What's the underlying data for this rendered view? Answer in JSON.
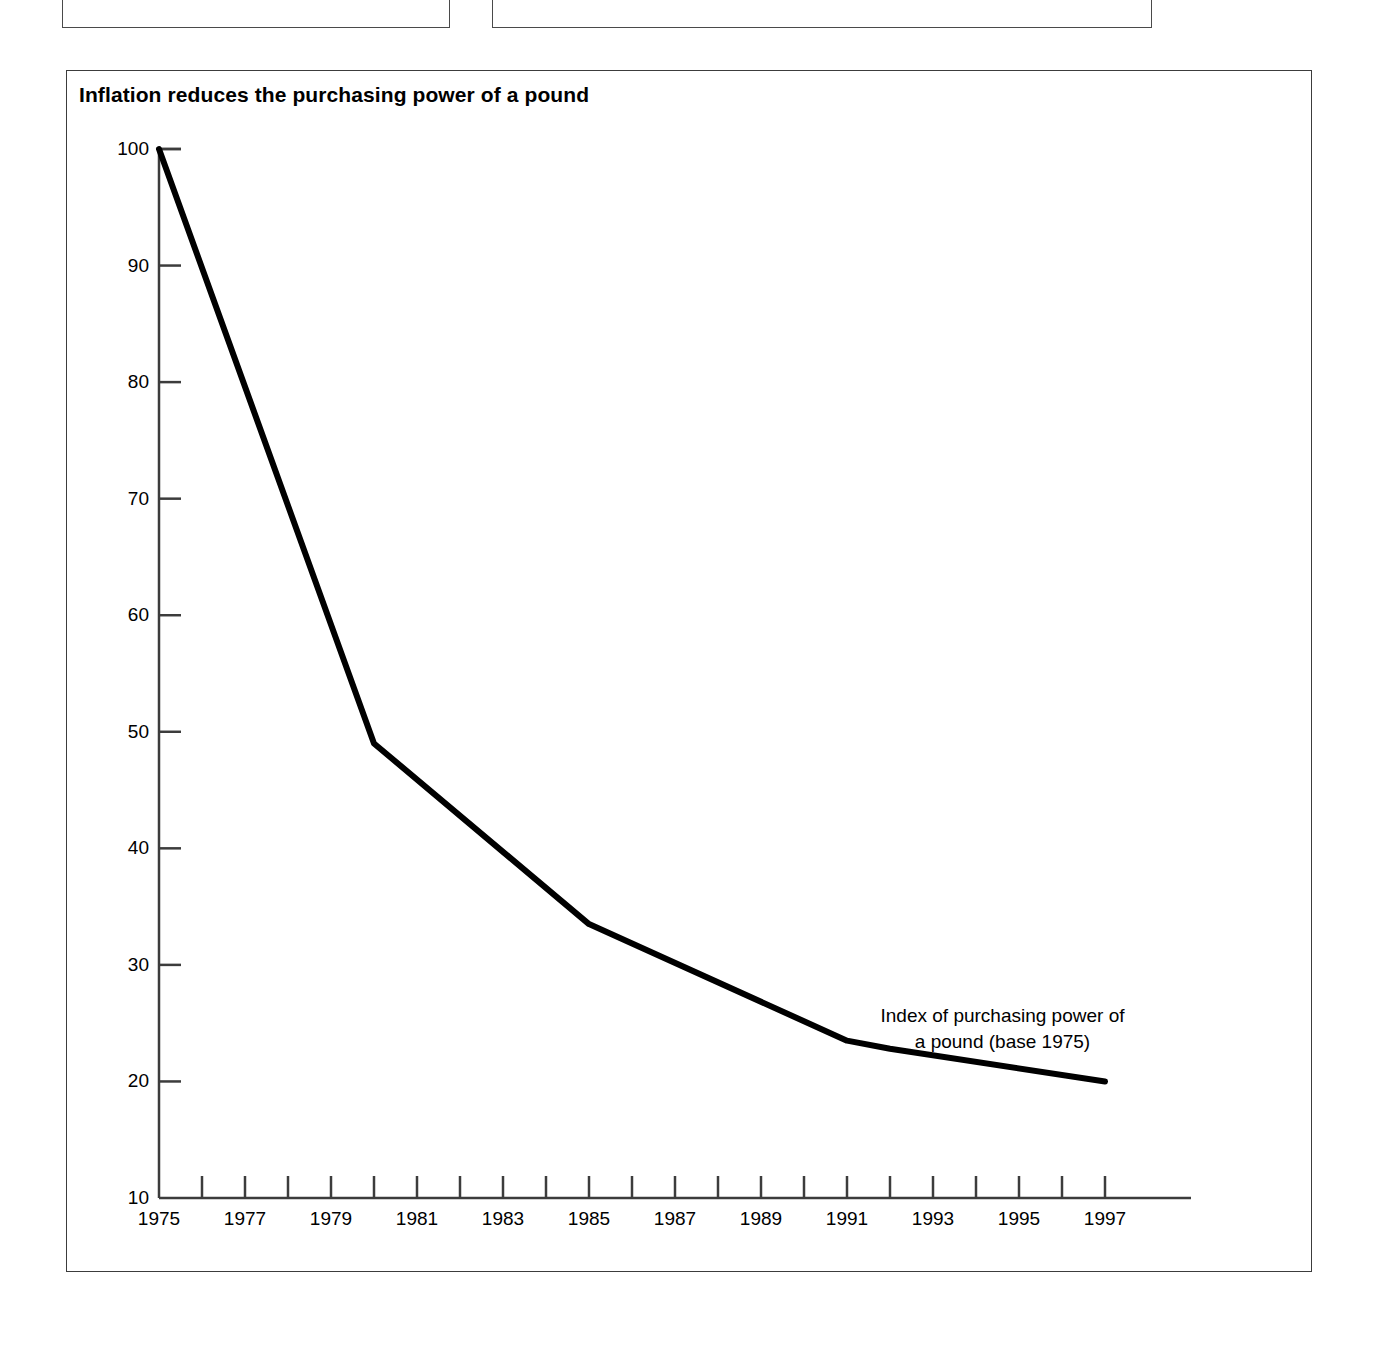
{
  "page": {
    "top_fragments": [
      {
        "name": "left-cut-box",
        "ghost_text": ""
      },
      {
        "name": "right-cut-box",
        "ghost_text": ""
      }
    ]
  },
  "chart_data": {
    "type": "line",
    "title": "Inflation reduces the purchasing power of a pound",
    "xlabel": "",
    "ylabel": "",
    "xlim": [
      1975,
      1999
    ],
    "ylim": [
      10,
      100
    ],
    "grid": false,
    "legend": "inline-annotation",
    "annotations": [
      {
        "name": "series-label",
        "line1": "Index of purchasing power of",
        "line2": "a pound (base 1975)",
        "x": 1995.5,
        "y": 24.5
      }
    ],
    "axis": {
      "y_ticks": [
        10,
        20,
        30,
        40,
        50,
        60,
        70,
        80,
        90,
        100
      ],
      "y_tick_labels": [
        "10",
        "20",
        "30",
        "40",
        "50",
        "60",
        "70",
        "80",
        "90",
        "100"
      ],
      "x_major_ticks": [
        1975,
        1977,
        1979,
        1981,
        1983,
        1985,
        1987,
        1989,
        1991,
        1993,
        1995,
        1997
      ],
      "x_major_tick_labels": [
        "1975",
        "1977",
        "1979",
        "1981",
        "1983",
        "1985",
        "1987",
        "1989",
        "1991",
        "1993",
        "1995",
        "1997"
      ],
      "x_minor_ticks": [
        1976,
        1978,
        1980,
        1982,
        1984,
        1986,
        1988,
        1990,
        1992,
        1994,
        1996
      ],
      "x_axis_extends_to": 1999
    },
    "series": [
      {
        "name": "Index of purchasing power of a pound (base 1975)",
        "color": "#000000",
        "line_width": 6,
        "x": [
          1975,
          1980,
          1985,
          1991,
          1992,
          1997
        ],
        "values": [
          100,
          49,
          33.5,
          23.5,
          22.8,
          20.0
        ],
        "points": [
          {
            "x": 1975,
            "y": 100
          },
          {
            "x": 1980,
            "y": 49
          },
          {
            "x": 1985,
            "y": 33.5
          },
          {
            "x": 1991,
            "y": 23.5
          },
          {
            "x": 1992,
            "y": 22.8
          },
          {
            "x": 1997,
            "y": 20.0
          }
        ]
      }
    ]
  },
  "colors": {
    "series": "#000000",
    "axis": "#3c3c3c",
    "frame": "#3c3c3c",
    "background": "#ffffff"
  }
}
